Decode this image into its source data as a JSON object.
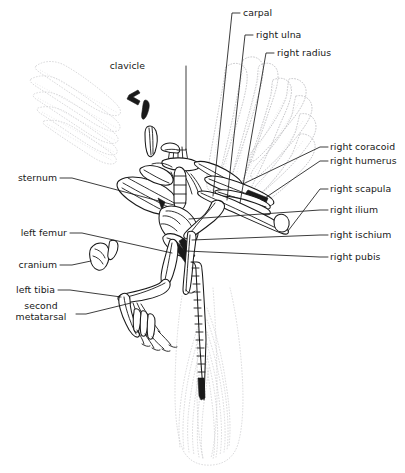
{
  "figure": {
    "background_color": "#ffffff",
    "line_color": "#1a1a1a",
    "feather_color": "#b9b9bd",
    "view": "slab / fossil impression, dorsal-lateral"
  },
  "labels": [
    {
      "id": "carpal",
      "text": "carpal",
      "align": "left",
      "x": 243,
      "y": 8,
      "points_to": "left carpal bones of right wing"
    },
    {
      "id": "right-ulna",
      "text": "right ulna",
      "align": "left",
      "x": 256,
      "y": 30,
      "points_to": "right ulna"
    },
    {
      "id": "right-radius",
      "text": "right radius",
      "align": "left",
      "x": 277,
      "y": 48,
      "points_to": "right radius"
    },
    {
      "id": "clavicle",
      "text": "clavicle",
      "align": "right",
      "x": 145,
      "y": 61,
      "points_to": "clavicle / furcula"
    },
    {
      "id": "right-coracoid",
      "text": "right coracoid",
      "align": "left",
      "x": 330,
      "y": 143,
      "points_to": "right coracoid"
    },
    {
      "id": "right-humerus",
      "text": "right humerus",
      "align": "left",
      "x": 330,
      "y": 156,
      "points_to": "right humerus"
    },
    {
      "id": "sternum",
      "text": "sternum",
      "align": "right",
      "x": 13,
      "y": 173,
      "points_to": "sternum"
    },
    {
      "id": "right-scapula",
      "text": "right scapula",
      "align": "left",
      "x": 330,
      "y": 184,
      "points_to": "right scapula"
    },
    {
      "id": "right-ilium",
      "text": "right ilium",
      "align": "left",
      "x": 330,
      "y": 205,
      "points_to": "right ilium"
    },
    {
      "id": "left-femur",
      "text": "left femur",
      "align": "right",
      "x": 13,
      "y": 228,
      "points_to": "left femur"
    },
    {
      "id": "right-ischium",
      "text": "right ischium",
      "align": "left",
      "x": 330,
      "y": 230,
      "points_to": "right ischium"
    },
    {
      "id": "cranium",
      "text": "cranium",
      "align": "right",
      "x": 13,
      "y": 260,
      "points_to": "cranium"
    },
    {
      "id": "right-pubis",
      "text": "right pubis",
      "align": "left",
      "x": 330,
      "y": 252,
      "points_to": "right pubis"
    },
    {
      "id": "left-tibia",
      "text": "left tibia",
      "align": "right",
      "x": 13,
      "y": 285,
      "points_to": "left tibia"
    },
    {
      "id": "second-metatarsal",
      "text": "second\nmetatarsal",
      "align": "center",
      "x": 14,
      "y": 300,
      "points_to": "second metatarsal"
    }
  ],
  "anatomy_parts": [
    "cranium",
    "clavicle",
    "sternum",
    "right coracoid",
    "right scapula",
    "right humerus",
    "right radius",
    "right ulna",
    "carpal",
    "right ilium",
    "right ischium",
    "right pubis",
    "left femur",
    "left tibia",
    "second metatarsal",
    "caudal vertebrae",
    "feather impressions"
  ]
}
